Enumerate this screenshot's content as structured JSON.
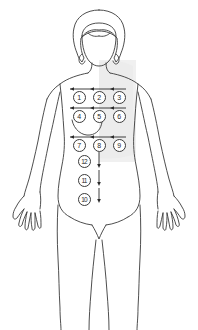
{
  "diagram": {
    "view": "anterior",
    "background_color": "#ffffff",
    "outline_color": "#3a3a3a",
    "shading_color": "#efefef",
    "marker_text_color": "#2a2a2a",
    "marker_fill_color": "#ffffff"
  },
  "sites": [
    {
      "label": "1",
      "x": 79,
      "y": 97,
      "row": "upper",
      "column": "left"
    },
    {
      "label": "2",
      "x": 99,
      "y": 97,
      "row": "upper",
      "column": "center"
    },
    {
      "label": "3",
      "x": 119,
      "y": 97,
      "row": "upper",
      "column": "right"
    },
    {
      "label": "4",
      "x": 79,
      "y": 116,
      "row": "middle",
      "column": "left"
    },
    {
      "label": "5",
      "x": 99,
      "y": 116,
      "row": "middle",
      "column": "center"
    },
    {
      "label": "6",
      "x": 119,
      "y": 116,
      "row": "middle",
      "column": "right"
    },
    {
      "label": "7",
      "x": 79,
      "y": 145,
      "row": "lower",
      "column": "left"
    },
    {
      "label": "8",
      "x": 99,
      "y": 145,
      "row": "lower",
      "column": "center"
    },
    {
      "label": "9",
      "x": 119,
      "y": 145,
      "row": "lower",
      "column": "right"
    },
    {
      "label": "12",
      "x": 84,
      "y": 161,
      "row": "midline-1",
      "column": "center"
    },
    {
      "label": "11",
      "x": 84,
      "y": 180,
      "row": "midline-2",
      "column": "center"
    },
    {
      "label": "10",
      "x": 84,
      "y": 199,
      "row": "midline-3",
      "column": "center"
    }
  ],
  "row_arrows": [
    {
      "name": "upper-row-arrow",
      "y": 89,
      "x_start": 70,
      "x_end": 126
    },
    {
      "name": "middle-row-arrow",
      "y": 108,
      "x_start": 70,
      "x_end": 126
    },
    {
      "name": "lower-row-arrow",
      "y": 137,
      "x_start": 70,
      "x_end": 126
    }
  ],
  "vertical_arrow": {
    "name": "midline-descending-arrow",
    "x": 99,
    "y_start": 152,
    "y_end": 203,
    "direction": "down"
  }
}
